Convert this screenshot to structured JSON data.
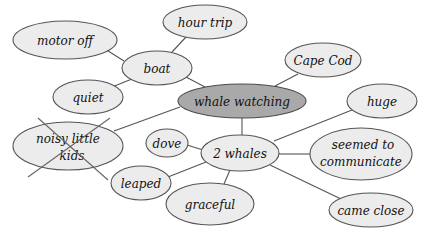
{
  "diagram": {
    "title": "whale watching",
    "type": "web / cluster map",
    "colors": {
      "central_fill": "#a9a9a9",
      "node_fill": "#ececec",
      "stroke": "#555555",
      "background": "#ffffff"
    },
    "nodes": {
      "whale_watching": {
        "label": "whale watching",
        "central": true
      },
      "boat": {
        "label": "boat"
      },
      "motor_off": {
        "label": "motor off"
      },
      "hour_trip": {
        "label": "hour trip"
      },
      "quiet": {
        "label": "quiet"
      },
      "noisy_little_kids": {
        "line1": "noisy little",
        "line2": "kids",
        "crossed_out": true
      },
      "cape_cod": {
        "label": "Cape Cod"
      },
      "two_whales": {
        "label": "2 whales"
      },
      "huge": {
        "label": "huge"
      },
      "seemed_to_communicate": {
        "line1": "seemed to",
        "line2": "communicate"
      },
      "dove": {
        "label": "dove"
      },
      "leaped": {
        "label": "leaped"
      },
      "graceful": {
        "label": "graceful"
      },
      "came_close": {
        "label": "came close"
      }
    },
    "edges": [
      [
        "whale_watching",
        "boat"
      ],
      [
        "whale_watching",
        "cape_cod"
      ],
      [
        "whale_watching",
        "two_whales"
      ],
      [
        "whale_watching",
        "noisy_little_kids"
      ],
      [
        "boat",
        "motor_off"
      ],
      [
        "boat",
        "hour_trip"
      ],
      [
        "boat",
        "quiet"
      ],
      [
        "two_whales",
        "huge"
      ],
      [
        "two_whales",
        "seemed_to_communicate"
      ],
      [
        "two_whales",
        "came_close"
      ],
      [
        "two_whales",
        "graceful"
      ],
      [
        "two_whales",
        "leaped"
      ],
      [
        "two_whales",
        "dove"
      ]
    ]
  }
}
